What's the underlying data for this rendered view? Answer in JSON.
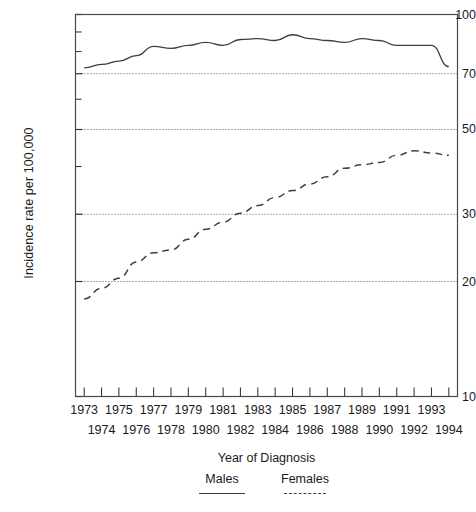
{
  "chart_data": {
    "type": "line",
    "title": "",
    "xlabel": "Year of Diagnosis",
    "ylabel": "Incidence rate per 100,000",
    "yscale": "log",
    "ylim": [
      10,
      100
    ],
    "yticks": [
      10,
      20,
      30,
      50,
      70,
      100
    ],
    "ytick_labels": [
      "10",
      "20",
      "30",
      "50",
      "70",
      "100"
    ],
    "y_minor_ticks": [
      40,
      60,
      80,
      90
    ],
    "gridlines": [
      20,
      30,
      50,
      70
    ],
    "grid": true,
    "legend_position": "bottom",
    "x": [
      1973,
      1974,
      1975,
      1976,
      1977,
      1978,
      1979,
      1980,
      1981,
      1982,
      1983,
      1984,
      1985,
      1986,
      1987,
      1988,
      1989,
      1990,
      1991,
      1992,
      1993,
      1994
    ],
    "categories": [
      "1973",
      "1974",
      "1975",
      "1976",
      "1977",
      "1978",
      "1979",
      "1980",
      "1981",
      "1982",
      "1983",
      "1984",
      "1985",
      "1986",
      "1987",
      "1988",
      "1989",
      "1990",
      "1991",
      "1992",
      "1993",
      "1994"
    ],
    "xtick_labels_top": [
      "1973",
      "1975",
      "1977",
      "1979",
      "1981",
      "1983",
      "1985",
      "1987",
      "1989",
      "1991",
      "1993"
    ],
    "xtick_labels_bottom": [
      "1974",
      "1976",
      "1978",
      "1980",
      "1982",
      "1984",
      "1986",
      "1988",
      "1990",
      "1992",
      "1994"
    ],
    "series": [
      {
        "name": "Males",
        "style": "solid",
        "color": "#3f3f3f",
        "values": [
          72.5,
          74.0,
          75.5,
          78.0,
          82.5,
          81.5,
          83.0,
          84.5,
          83.0,
          86.0,
          86.5,
          85.5,
          88.5,
          86.5,
          85.5,
          84.5,
          86.5,
          85.5,
          83.0,
          83.0,
          83.0,
          73.0
        ]
      },
      {
        "name": "Females",
        "style": "dashed",
        "color": "#3f3f3f",
        "values": [
          18.0,
          19.2,
          20.4,
          22.5,
          23.8,
          24.2,
          25.8,
          27.4,
          28.6,
          30.2,
          31.6,
          33.2,
          34.6,
          36.0,
          37.6,
          39.6,
          40.4,
          41.0,
          42.8,
          44.0,
          43.4,
          42.8
        ]
      }
    ]
  },
  "legend": {
    "items": [
      {
        "label": "Males",
        "style": "solid"
      },
      {
        "label": "Females",
        "style": "dashed"
      }
    ]
  }
}
